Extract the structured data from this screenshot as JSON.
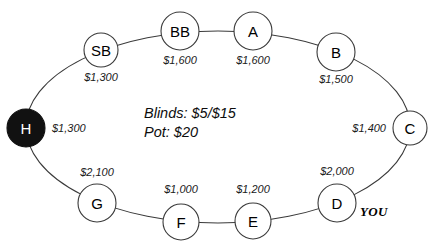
{
  "diagram": {
    "center_info": {
      "blinds_line": "Blinds: $5/$15",
      "pot_line": "Pot: $20"
    },
    "hero_tag": "YOU",
    "hero_seat": "D",
    "dealer_seat": "H",
    "seats": [
      {
        "id": "sb",
        "label": "SB",
        "stack": "$1,300",
        "cx": 101,
        "cy": 50,
        "r": 17,
        "lx": 101,
        "ly": 77,
        "anchor": "middle",
        "dealer": false
      },
      {
        "id": "bb",
        "label": "BB",
        "stack": "$1,600",
        "cx": 180,
        "cy": 31,
        "r": 19,
        "lx": 180,
        "ly": 60,
        "anchor": "middle",
        "dealer": false
      },
      {
        "id": "a",
        "label": "A",
        "stack": "$1,600",
        "cx": 253,
        "cy": 31,
        "r": 19,
        "lx": 253,
        "ly": 60,
        "anchor": "middle",
        "dealer": false
      },
      {
        "id": "b",
        "label": "B",
        "stack": "$1,500",
        "cx": 336,
        "cy": 52,
        "r": 19,
        "lx": 336,
        "ly": 79,
        "anchor": "middle",
        "dealer": false
      },
      {
        "id": "c",
        "label": "C",
        "stack": "$1,400",
        "cx": 410,
        "cy": 128,
        "r": 17,
        "lx": 386,
        "ly": 128,
        "anchor": "end",
        "dealer": false
      },
      {
        "id": "d",
        "label": "D",
        "stack": "$2,000",
        "cx": 337,
        "cy": 203,
        "r": 19,
        "lx": 337,
        "ly": 171,
        "anchor": "middle",
        "dealer": false
      },
      {
        "id": "e",
        "label": "E",
        "stack": "$1,200",
        "cx": 253,
        "cy": 221,
        "r": 18,
        "lx": 253,
        "ly": 189,
        "anchor": "middle",
        "dealer": false
      },
      {
        "id": "f",
        "label": "F",
        "stack": "$1,000",
        "cx": 181,
        "cy": 222,
        "r": 18,
        "lx": 181,
        "ly": 189,
        "anchor": "middle",
        "dealer": false
      },
      {
        "id": "g",
        "label": "G",
        "stack": "$2,100",
        "cx": 97,
        "cy": 203,
        "r": 19,
        "lx": 97,
        "ly": 172,
        "anchor": "middle",
        "dealer": false
      },
      {
        "id": "h",
        "label": "H",
        "stack": "$1,300",
        "cx": 26,
        "cy": 128,
        "r": 19,
        "lx": 52,
        "ly": 128,
        "anchor": "start",
        "dealer": true
      }
    ],
    "center_text_x": 144,
    "center_blinds_y": 113,
    "center_pot_y": 132,
    "hero_tag_x": 360,
    "hero_tag_y": 211,
    "ring": {
      "cx": 218,
      "cy": 127,
      "rx": 192,
      "ry": 96
    },
    "colors": {
      "stroke": "#3a3a3a",
      "dealer_fill": "#111111",
      "seat_fill": "#ffffff",
      "text": "#000000",
      "background": "#ffffff"
    }
  }
}
